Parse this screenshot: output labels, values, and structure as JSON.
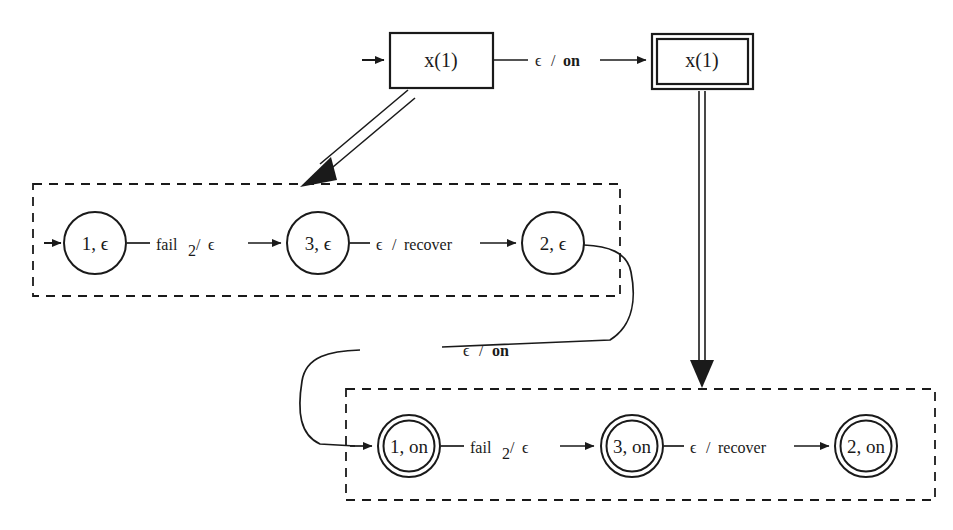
{
  "diagram": {
    "background_color": "#ffffff",
    "ink_color": "#1a1a1a",
    "top_boxes": [
      {
        "id": "box-x1-left",
        "label": "x(1)",
        "style": "single-border"
      },
      {
        "id": "box-x1-right",
        "label": "x(1)",
        "style": "double-border"
      }
    ],
    "top_transition": {
      "id": "edge-x1-to-x1",
      "input": "ϵ",
      "separator": "/",
      "output": "on",
      "output_bold": true,
      "label": "ϵ / on"
    },
    "regions": [
      {
        "id": "region-epsilon",
        "name": "epsilon-region",
        "border": "dashed",
        "states": [
          {
            "id": "state-1-eps",
            "label": "1, ϵ",
            "accepting": false,
            "initial": true
          },
          {
            "id": "state-3-eps",
            "label": "3, ϵ",
            "accepting": false,
            "initial": false
          },
          {
            "id": "state-2-eps",
            "label": "2, ϵ",
            "accepting": false,
            "initial": false
          }
        ],
        "transitions": [
          {
            "id": "edge-1eps-3eps",
            "from": "1, ϵ",
            "to": "3, ϵ",
            "label": "fail2 / ϵ",
            "input": "fail",
            "input_subscript": "2",
            "output": "ϵ"
          },
          {
            "id": "edge-3eps-2eps",
            "from": "3, ϵ",
            "to": "2, ϵ",
            "label": "ϵ / recover",
            "input": "ϵ",
            "output": "recover"
          }
        ]
      },
      {
        "id": "region-on",
        "name": "on-region",
        "border": "dashed",
        "states": [
          {
            "id": "state-1-on",
            "label": "1, on",
            "accepting": true,
            "initial": false
          },
          {
            "id": "state-3-on",
            "label": "3, on",
            "accepting": true,
            "initial": false
          },
          {
            "id": "state-2-on",
            "label": "2, on",
            "accepting": true,
            "initial": false
          }
        ],
        "transitions": [
          {
            "id": "edge-1on-3on",
            "from": "1, on",
            "to": "3, on",
            "label": "fail2 / ϵ",
            "input": "fail",
            "input_subscript": "2",
            "output": "ϵ"
          },
          {
            "id": "edge-3on-2on",
            "from": "3, on",
            "to": "2, on",
            "label": "ϵ / recover",
            "input": "ϵ",
            "output": "recover"
          }
        ]
      }
    ],
    "cross_transition": {
      "id": "edge-2eps-to-1on",
      "from": "2, ϵ",
      "to": "1, on",
      "input": "ϵ",
      "separator": "/",
      "output": "on",
      "output_bold": true,
      "label": "ϵ / on"
    },
    "refinement_arrows": [
      {
        "id": "refine-left",
        "from": "x(1)",
        "to": "epsilon-region",
        "style": "double-line-arrow",
        "direction": "down-left"
      },
      {
        "id": "refine-right",
        "from": "x(1)",
        "to": "on-region",
        "style": "double-line-arrow",
        "direction": "down"
      }
    ],
    "glyphs": {
      "epsilon": "ϵ",
      "slash": "/",
      "fail_label": "fail",
      "fail_subscript": "2",
      "recover_label": "recover",
      "on_label": "on",
      "box_label": "x(1)"
    }
  }
}
